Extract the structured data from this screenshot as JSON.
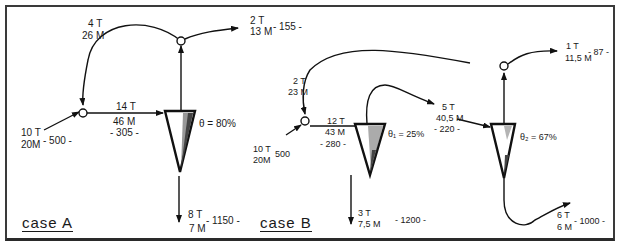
{
  "case_a": {
    "title": "case A",
    "feed": {
      "t": "10 T",
      "m": "20M",
      "v": "- 500 -"
    },
    "recycle": {
      "t": "4 T",
      "m": "26 M"
    },
    "cyclone_feed": {
      "t": "14 T",
      "m": "46 M",
      "v": "- 305 -"
    },
    "overflow": {
      "t": "2 T",
      "m": "13 M",
      "v": "- 155 -"
    },
    "underflow": {
      "t": "8 T",
      "m": "7 M",
      "v": "- 1150 -"
    },
    "efficiency": "θ = 80%"
  },
  "case_b": {
    "title": "case B",
    "feed": {
      "t": "10 T",
      "m": "20M",
      "v": "500"
    },
    "recycle": {
      "t": "2 T",
      "m": "23 M"
    },
    "cyclone1_feed": {
      "t": "12 T",
      "m": "43 M",
      "v": "- 280 -"
    },
    "cyclone1_overflow": {
      "t": "5 T",
      "m": "40,5 M",
      "v": "- 220 -"
    },
    "cyclone1_underflow": {
      "t": "3 T",
      "m": "7,5 M",
      "v": "- 1200 -"
    },
    "cyclone1_efficiency": "θ₁ = 25%",
    "cyclone2_overflow": {
      "t": "1 T",
      "m": "11,5 M",
      "v": "- 87 -"
    },
    "cyclone2_underflow": {
      "t": "6 T",
      "m": "6 M",
      "v": "- 1000 -"
    },
    "cyclone2_efficiency": "θ₂ = 67%"
  }
}
